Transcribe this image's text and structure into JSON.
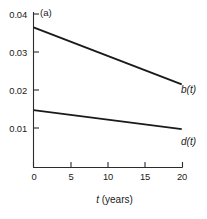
{
  "chart_data": {
    "type": "line",
    "title": "",
    "panel_label": "(a)",
    "xlabel_var": "t",
    "xlabel_unit": "(years)",
    "ylabel": "",
    "xlim": [
      0,
      20
    ],
    "ylim": [
      0.0015,
      0.04
    ],
    "grid": false,
    "legend_position": "right-of-line-ends",
    "x_ticks": [
      0,
      5,
      10,
      15,
      20
    ],
    "x_tick_labels": [
      "0",
      "5",
      "10",
      "15",
      "20"
    ],
    "y_ticks": [
      0.01,
      0.02,
      0.03,
      0.04
    ],
    "y_tick_labels": [
      "0.01",
      "0.02",
      "0.03",
      "0.04"
    ],
    "series": [
      {
        "name": "b(t)",
        "label_var": "b",
        "label_arg": "(t)",
        "x": [
          0,
          19.9
        ],
        "values": [
          0.0365,
          0.0215
        ]
      },
      {
        "name": "d(t)",
        "label_var": "d",
        "label_arg": "(t)",
        "x": [
          0,
          19.9
        ],
        "values": [
          0.0147,
          0.0097
        ]
      }
    ]
  },
  "axes": {
    "y_tick_labels": [
      "0.04",
      "0.03",
      "0.02",
      "0.01"
    ],
    "x_tick_labels": [
      "0",
      "5",
      "10",
      "15",
      "20"
    ]
  },
  "labels": {
    "panel": "(a)",
    "x_title_var": "t",
    "x_title_unit": "(years)",
    "series_b_var": "b",
    "series_b_arg": "(t)",
    "series_d_var": "d",
    "series_d_arg": "(t)"
  }
}
